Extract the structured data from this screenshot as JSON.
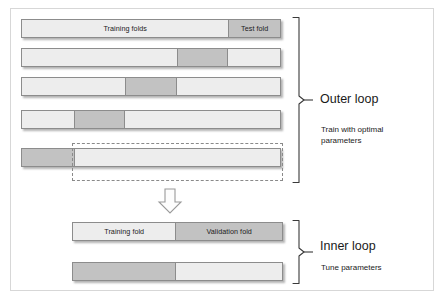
{
  "diagram": {
    "colors": {
      "light_fold": "#ededed",
      "dark_fold": "#c2c2c2",
      "bar_border": "#8c8c8c",
      "frame_border": "#d7d7d7",
      "dashed_border": "#8a8a8a",
      "text": "#1a1a1a",
      "background": "#ffffff"
    },
    "outer_loop": {
      "title": "Outer loop",
      "caption": "Train with optimal parameters",
      "bars": [
        {
          "row": 1,
          "segments": [
            {
              "label": "Training folds",
              "shade": "light",
              "width_pct": 80
            },
            {
              "label": "Test fold",
              "shade": "dark",
              "width_pct": 20
            }
          ]
        },
        {
          "row": 2,
          "segments": [
            {
              "label": "",
              "shade": "light",
              "width_pct": 60
            },
            {
              "label": "",
              "shade": "dark",
              "width_pct": 20
            },
            {
              "label": "",
              "shade": "light",
              "width_pct": 20
            }
          ]
        },
        {
          "row": 3,
          "segments": [
            {
              "label": "",
              "shade": "light",
              "width_pct": 40
            },
            {
              "label": "",
              "shade": "dark",
              "width_pct": 20
            },
            {
              "label": "",
              "shade": "light",
              "width_pct": 40
            }
          ]
        },
        {
          "row": 4,
          "segments": [
            {
              "label": "",
              "shade": "light",
              "width_pct": 20
            },
            {
              "label": "",
              "shade": "dark",
              "width_pct": 20
            },
            {
              "label": "",
              "shade": "light",
              "width_pct": 60
            }
          ]
        },
        {
          "row": 5,
          "segments": [
            {
              "label": "",
              "shade": "dark",
              "width_pct": 20
            },
            {
              "label": "",
              "shade": "light",
              "width_pct": 80
            }
          ]
        }
      ]
    },
    "inner_loop": {
      "title": "Inner loop",
      "caption": "Tune parameters",
      "bars": [
        {
          "row": 1,
          "segments": [
            {
              "label": "Training fold",
              "shade": "light",
              "width_pct": 49
            },
            {
              "label": "Validation fold",
              "shade": "dark",
              "width_pct": 51
            }
          ]
        },
        {
          "row": 2,
          "segments": [
            {
              "label": "",
              "shade": "dark",
              "width_pct": 49
            },
            {
              "label": "",
              "shade": "light",
              "width_pct": 51
            }
          ]
        }
      ]
    },
    "icons": {
      "flow_arrow": "down-arrow-icon",
      "outer_brace": "right-brace-icon",
      "inner_brace": "right-brace-icon"
    }
  }
}
